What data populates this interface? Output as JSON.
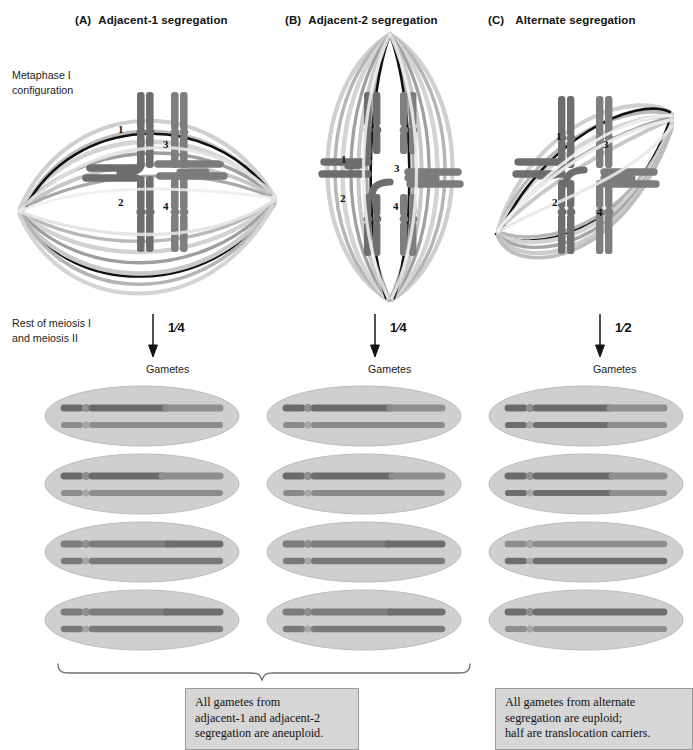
{
  "figure": {
    "title_hidden": "Segregation patterns of a reciprocal translocation quadrivalent at meiosis I"
  },
  "panels": [
    {
      "id": "A",
      "letter": "(A)",
      "title": "Adjacent-1 segregation",
      "fraction": "1/4",
      "fraction_num": "1",
      "fraction_den": "4",
      "gametes_label": "Gametes",
      "chromosome_numbers": [
        "1",
        "3",
        "2",
        "4"
      ],
      "spindle_orientation": "horizontal",
      "gamete_count": 4
    },
    {
      "id": "B",
      "letter": "(B)",
      "title": "Adjacent-2 segregation",
      "fraction": "1/4",
      "fraction_num": "1",
      "fraction_den": "4",
      "gametes_label": "Gametes",
      "chromosome_numbers": [
        "1",
        "3",
        "2",
        "4"
      ],
      "spindle_orientation": "vertical",
      "gamete_count": 4
    },
    {
      "id": "C",
      "letter": "(C)",
      "title": "Alternate segregation",
      "fraction": "1/2",
      "fraction_num": "1",
      "fraction_den": "2",
      "gametes_label": "Gametes",
      "chromosome_numbers": [
        "1",
        "3",
        "2",
        "4"
      ],
      "spindle_orientation": "diagonal",
      "gamete_count": 4
    }
  ],
  "side_labels": {
    "metaphase": "Metaphase I\nconfiguration",
    "meiosis": "Rest of meiosis I\nand meiosis II"
  },
  "captions": [
    {
      "id": "aneuploid",
      "text": "All gametes from\nadjacent-1 and adjacent-2\nsegregation are aneuploid."
    },
    {
      "id": "euploid",
      "text": "All gametes from alternate\nsegregation are euploid;\nhalf are translocation carriers."
    }
  ],
  "colors": {
    "chromosome_dark": "#6d6d6d",
    "chromosome_mid": "#8c8c8c",
    "chromosome_light": "#a8a8a8",
    "spindle_black": "#101010",
    "spindle_dark": "#787878",
    "spindle_light": "#c9c9c9",
    "gamete_fill": "#cfcfcf",
    "gamete_stroke": "#b4b4b4",
    "caption_bg": "#d6d6d6",
    "caption_border": "#9a9a9a",
    "text": "#1a1a1a"
  }
}
